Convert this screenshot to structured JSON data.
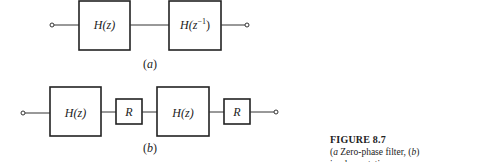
{
  "diagram_a": {
    "label": "(a)",
    "input_terminal": "input",
    "blocks": [
      {
        "id": "a1",
        "text": "H(z)"
      },
      {
        "id": "a2",
        "text": "H(z",
        "sup": "−1",
        "close": ")"
      }
    ],
    "output_terminal": "output"
  },
  "diagram_b": {
    "label": "(b)",
    "blocks": [
      {
        "id": "b1",
        "text": "H(z)"
      },
      {
        "id": "b2",
        "text": "R"
      },
      {
        "id": "b3",
        "text": "H(z)"
      },
      {
        "id": "b4",
        "text": "R"
      }
    ]
  },
  "caption": {
    "title": "FIGURE 8.7",
    "a_tag": "a",
    "a_text": " Zero-phase filter, (",
    "b_tag": "b",
    "b_text": ") implementation."
  }
}
